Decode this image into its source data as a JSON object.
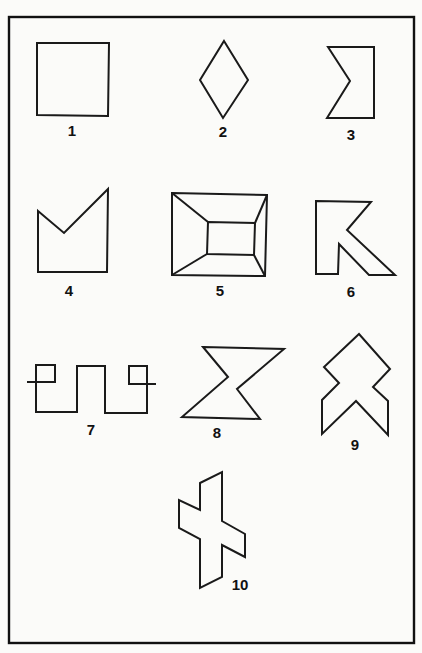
{
  "figure": {
    "figures": [
      {
        "number": "1",
        "shape": "square"
      },
      {
        "number": "2",
        "shape": "diamond"
      },
      {
        "number": "3",
        "shape": "notched rectangle (left V-notch)"
      },
      {
        "number": "4",
        "shape": "pentagon with V-shaped top"
      },
      {
        "number": "5",
        "shape": "rectangle within rectangle (frame / truncated pyramid view)"
      },
      {
        "number": "6",
        "shape": "K-like angular shape"
      },
      {
        "number": "7",
        "shape": "square-wave line with crossing end loops"
      },
      {
        "number": "8",
        "shape": "hourglass / bow-tie"
      },
      {
        "number": "9",
        "shape": "stacked chevron arrow"
      },
      {
        "number": "10",
        "shape": "skewed cross"
      }
    ]
  }
}
